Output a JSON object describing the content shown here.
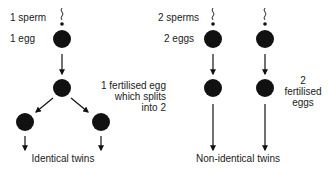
{
  "colors": {
    "ink": "#111111",
    "text": "#1a1a1a",
    "background": "#ffffff"
  },
  "left": {
    "sperm_label": "1 sperm",
    "egg_label": "1 egg",
    "fertilised_label_line1": "1 fertilised egg",
    "fertilised_label_line2": "which splits",
    "fertilised_label_line3": "into 2",
    "caption": "Identical twins"
  },
  "right": {
    "sperm_label": "2 sperms",
    "egg_label": "2 eggs",
    "fertilised_label_line1": "2",
    "fertilised_label_line2": "fertilised",
    "fertilised_label_line3": "eggs",
    "caption": "Non-identical twins"
  }
}
